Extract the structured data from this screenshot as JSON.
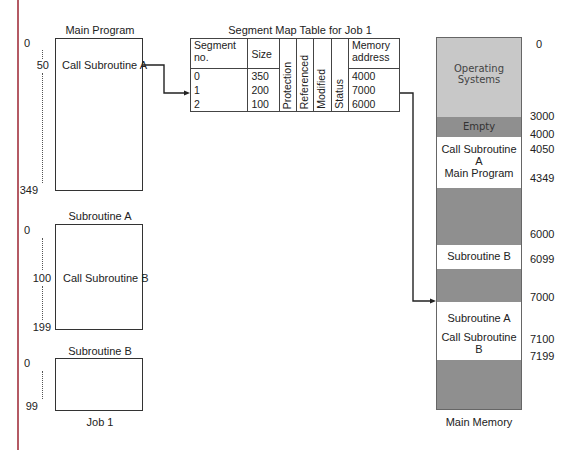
{
  "job": {
    "label": "Job 1",
    "main_program": {
      "title": "Main Program",
      "content": "Call Subroutine A",
      "line_labels": [
        "0",
        "50",
        "349"
      ]
    },
    "subroutine_a": {
      "title": "Subroutine A",
      "content": "Call Subroutine B",
      "line_labels": [
        "0",
        "100",
        "199"
      ]
    },
    "subroutine_b": {
      "title": "Subroutine B",
      "content": "",
      "line_labels": [
        "0",
        "99"
      ]
    }
  },
  "segment_map_table": {
    "title": "Segment Map Table for Job 1",
    "headers": [
      "Segment no.",
      "Size",
      "Protection",
      "Referenced",
      "Modified",
      "Status",
      "Memory address"
    ],
    "rows": [
      {
        "segment": "0",
        "size": "350",
        "address": "4000"
      },
      {
        "segment": "1",
        "size": "200",
        "address": "7000"
      },
      {
        "segment": "2",
        "size": "100",
        "address": "6000"
      }
    ]
  },
  "main_memory": {
    "label": "Main Memory",
    "blocks": [
      {
        "name": "operating-systems",
        "text": "Operating Systems",
        "color": "#c8c8c8"
      },
      {
        "name": "empty",
        "text": "Empty",
        "color": "#8f8f8f"
      },
      {
        "name": "main-program",
        "text_lines": [
          "Call Subroutine A",
          "Main Program"
        ],
        "color": "#ffffff"
      },
      {
        "name": "free-1",
        "text": "",
        "color": "#8f8f8f"
      },
      {
        "name": "subroutine-b",
        "text": "Subroutine B",
        "color": "#ffffff"
      },
      {
        "name": "free-2",
        "text": "",
        "color": "#8f8f8f"
      },
      {
        "name": "subroutine-a",
        "text_lines": [
          "Subroutine A",
          "Call Subroutine B"
        ],
        "color": "#ffffff"
      },
      {
        "name": "free-3",
        "text": "",
        "color": "#8f8f8f"
      }
    ],
    "addresses": [
      "0",
      "3000",
      "4000",
      "4050",
      "4349",
      "6000",
      "6099",
      "7000",
      "7100",
      "7199"
    ]
  },
  "colors": {
    "margin_line": "#b45a64",
    "os_block": "#c8c8c8",
    "free_block": "#8f8f8f",
    "line": "#222222"
  }
}
